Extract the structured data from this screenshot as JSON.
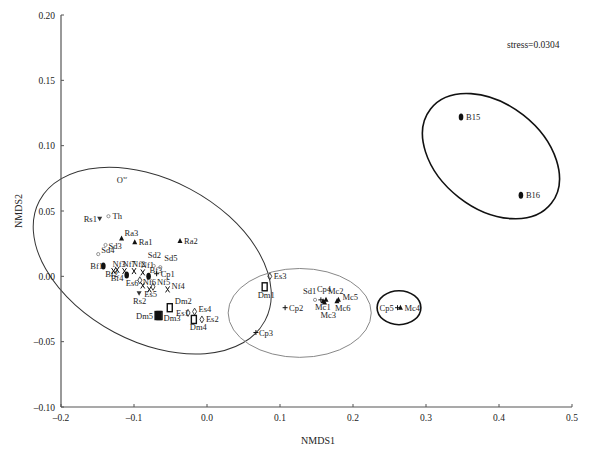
{
  "chart_data": {
    "type": "scatter",
    "title": "",
    "xlabel": "NMDS1",
    "ylabel": "NMDS2",
    "xlim": [
      -0.2,
      0.5
    ],
    "ylim": [
      -0.1,
      0.2
    ],
    "x_ticks": [
      "-0.2",
      "-0.1",
      "0.0",
      "0.1",
      "0.2",
      "0.3",
      "0.4",
      "0.5"
    ],
    "y_ticks": [
      "-0.10",
      "-0.05",
      "0.00",
      "0.05",
      "0.10",
      "0.15",
      "0.20"
    ],
    "grid": false,
    "annotation": "stress=0.0304",
    "points": [
      {
        "label": "O",
        "sup": "xr",
        "x": -0.129,
        "y": 0.074,
        "marker": "none"
      },
      {
        "label": "Rs1",
        "x": -0.147,
        "y": 0.044,
        "marker": "triangle-down"
      },
      {
        "label": "Th",
        "x": -0.135,
        "y": 0.046,
        "marker": "star"
      },
      {
        "label": "Ra3",
        "x": -0.117,
        "y": 0.029,
        "marker": "triangle"
      },
      {
        "label": "Ra1",
        "x": -0.099,
        "y": 0.026,
        "marker": "triangle"
      },
      {
        "label": "Ra2",
        "x": -0.037,
        "y": 0.027,
        "marker": "triangle"
      },
      {
        "label": "Sd3",
        "x": -0.139,
        "y": 0.024,
        "marker": "star"
      },
      {
        "label": "Sd4",
        "x": -0.149,
        "y": 0.017,
        "marker": "star"
      },
      {
        "label": "Bf1",
        "x": -0.142,
        "y": 0.008,
        "marker": "ellipse"
      },
      {
        "label": "Bf2",
        "x": -0.123,
        "y": 0.005,
        "marker": "x"
      },
      {
        "label": "Bf4",
        "x": -0.11,
        "y": 0.001,
        "marker": "ellipse"
      },
      {
        "label": "Bf3",
        "x": -0.08,
        "y": 0.0,
        "marker": "ellipse"
      },
      {
        "label": "Nf3",
        "x": -0.128,
        "y": 0.004,
        "marker": "x"
      },
      {
        "label": "Nf7",
        "x": -0.113,
        "y": 0.004,
        "marker": "x"
      },
      {
        "label": "Nf2",
        "x": -0.1,
        "y": 0.004,
        "marker": "x"
      },
      {
        "label": "Nf1",
        "x": -0.088,
        "y": 0.003,
        "marker": "x"
      },
      {
        "label": "Sd2",
        "x": -0.073,
        "y": 0.008,
        "marker": "star"
      },
      {
        "label": "Sd5",
        "x": -0.064,
        "y": 0.007,
        "marker": "star"
      },
      {
        "label": "Cp1",
        "x": -0.069,
        "y": 0.002,
        "marker": "plus"
      },
      {
        "label": "Es6",
        "x": -0.092,
        "y": -0.003,
        "marker": "diamond"
      },
      {
        "label": "Nf6",
        "x": -0.088,
        "y": -0.007,
        "marker": "x"
      },
      {
        "label": "Nf5",
        "x": -0.074,
        "y": -0.008,
        "marker": "diamond"
      },
      {
        "label": "Nf4",
        "x": -0.054,
        "y": -0.01,
        "marker": "x"
      },
      {
        "label": "Es5",
        "x": -0.079,
        "y": -0.01,
        "marker": "x"
      },
      {
        "label": "Rs2",
        "x": -0.093,
        "y": -0.013,
        "marker": "triangle-down"
      },
      {
        "label": "Dm2",
        "x": -0.051,
        "y": -0.024,
        "marker": "rect"
      },
      {
        "label": "Dm5",
        "x": -0.067,
        "y": -0.03,
        "marker": "rect-bold"
      },
      {
        "label": "Dm3",
        "x": -0.065,
        "y": -0.03,
        "marker": "rect"
      },
      {
        "label": "Es1",
        "x": -0.026,
        "y": -0.028,
        "marker": "diamond"
      },
      {
        "label": "Es4",
        "x": -0.017,
        "y": -0.027,
        "marker": "diamond"
      },
      {
        "label": "Dm4",
        "x": -0.018,
        "y": -0.033,
        "marker": "rect"
      },
      {
        "label": "Es2",
        "x": -0.007,
        "y": -0.033,
        "marker": "diamond"
      },
      {
        "label": "Es3",
        "x": 0.086,
        "y": 0.0,
        "marker": "diamond"
      },
      {
        "label": "Dm1",
        "x": 0.079,
        "y": -0.008,
        "marker": "rect"
      },
      {
        "label": "Cp2",
        "x": 0.107,
        "y": -0.024,
        "marker": "plus"
      },
      {
        "label": "Cp3",
        "x": 0.067,
        "y": -0.043,
        "marker": "plus"
      },
      {
        "label": "Sd1",
        "x": 0.148,
        "y": -0.018,
        "marker": "star"
      },
      {
        "label": "Cp4",
        "x": 0.156,
        "y": -0.018,
        "marker": "plus"
      },
      {
        "label": "Mc1",
        "x": 0.159,
        "y": -0.019,
        "marker": "triangle"
      },
      {
        "label": "Mc2",
        "x": 0.163,
        "y": -0.018,
        "marker": "triangle"
      },
      {
        "label": "Mc3",
        "x": 0.161,
        "y": -0.02,
        "marker": "triangle"
      },
      {
        "label": "Mc5",
        "x": 0.18,
        "y": -0.018,
        "marker": "triangle"
      },
      {
        "label": "Mc6",
        "x": 0.178,
        "y": -0.019,
        "marker": "triangle"
      },
      {
        "label": "Cp5",
        "x": 0.261,
        "y": -0.024,
        "marker": "plus"
      },
      {
        "label": "Mc4",
        "x": 0.265,
        "y": -0.024,
        "marker": "triangle"
      },
      {
        "label": "B15",
        "x": 0.348,
        "y": 0.122,
        "marker": "ellipse"
      },
      {
        "label": "B16",
        "x": 0.43,
        "y": 0.062,
        "marker": "ellipse"
      }
    ],
    "ellipses": [
      {
        "name": "cluster-left",
        "cx": -0.075,
        "cy": 0.012,
        "rx": 0.175,
        "ry": 0.062,
        "rotate": 28,
        "color": "#333333",
        "stroke": 1
      },
      {
        "name": "cluster-middle",
        "cx": 0.127,
        "cy": -0.028,
        "rx": 0.098,
        "ry": 0.034,
        "rotate": 0,
        "color": "#888888",
        "stroke": 1
      },
      {
        "name": "cluster-cp5-mc4",
        "cx": 0.263,
        "cy": -0.024,
        "rx": 0.03,
        "ry": 0.013,
        "rotate": 0,
        "color": "#111111",
        "stroke": 1.6
      },
      {
        "name": "cluster-b15-b16",
        "cx": 0.389,
        "cy": 0.092,
        "rx": 0.105,
        "ry": 0.04,
        "rotate": 38,
        "color": "#111111",
        "stroke": 1.6
      }
    ]
  }
}
